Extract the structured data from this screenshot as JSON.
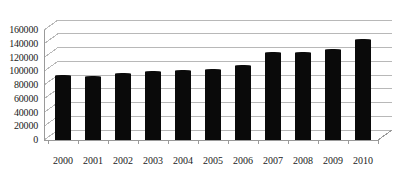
{
  "chart_data": {
    "type": "bar",
    "title": "",
    "subtitle": "",
    "xlabel": "",
    "ylabel": "",
    "categories": [
      "2000",
      "2001",
      "2002",
      "2003",
      "2004",
      "2005",
      "2006",
      "2007",
      "2008",
      "2009",
      "2010"
    ],
    "values": [
      93000,
      92000,
      96000,
      99000,
      101000,
      102000,
      108000,
      127000,
      126500,
      131000,
      145000
    ],
    "series": [
      {
        "name": "",
        "values": [
          93000,
          92000,
          96000,
          99000,
          101000,
          102000,
          108000,
          127000,
          126500,
          131000,
          145000
        ]
      }
    ],
    "ylim": [
      0,
      160000
    ],
    "yticks": [
      0,
      20000,
      40000,
      60000,
      80000,
      100000,
      120000,
      140000,
      160000
    ],
    "ytick_labels": [
      "0",
      "20000",
      "40000",
      "60000",
      "80000",
      "100000",
      "120000",
      "140000",
      "160000"
    ],
    "xtick_labels": [
      "2000",
      "2001",
      "2002",
      "2003",
      "2004",
      "2005",
      "2006",
      "2007",
      "2008",
      "2009",
      "2010"
    ],
    "grid": true,
    "grid_axis": "y",
    "legend": false,
    "legend_position": "none",
    "bar_color": "#0a0a0a",
    "grid_color": "#b8b8b8",
    "axis_color": "#9a9a9a",
    "background_color": "#ffffff",
    "style": "3d-column",
    "annotations": []
  }
}
